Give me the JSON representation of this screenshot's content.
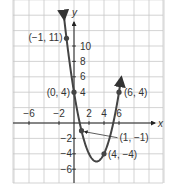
{
  "chart_data": {
    "type": "line",
    "title": "",
    "equation_implied": "y = x^2 - 6x + 4",
    "xlabel": "x",
    "ylabel": "y",
    "xlim": [
      -8,
      12
    ],
    "ylim": [
      -8,
      16
    ],
    "grid": true,
    "x_ticks": [
      {
        "value": -6,
        "label": "−6"
      },
      {
        "value": -2,
        "label": "−2"
      },
      {
        "value": 2,
        "label": "2"
      },
      {
        "value": 4,
        "label": "4"
      },
      {
        "value": 6,
        "label": "6"
      }
    ],
    "y_ticks": [
      {
        "value": 10,
        "label": "10"
      },
      {
        "value": 8,
        "label": "8"
      },
      {
        "value": 6,
        "label": "6"
      },
      {
        "value": 4,
        "label": "4"
      },
      {
        "value": -2,
        "label": "−2"
      },
      {
        "value": -4,
        "label": "−4"
      },
      {
        "value": -6,
        "label": "−6"
      }
    ],
    "points": [
      {
        "x": -1,
        "y": 11,
        "label": "(−1, 11)"
      },
      {
        "x": 0,
        "y": 4,
        "label": "(0, 4)"
      },
      {
        "x": 1,
        "y": -1,
        "label": "(1, −1)"
      },
      {
        "x": 4,
        "y": -4,
        "label": "(4, −4)"
      },
      {
        "x": 6,
        "y": 4,
        "label": "(6, 4)"
      }
    ],
    "series": [
      {
        "name": "parabola",
        "x": [
          -1.3,
          -1,
          0,
          1,
          2,
          3,
          4,
          5,
          6,
          6.3
        ],
        "values": [
          13.49,
          11,
          4,
          -1,
          -4,
          -5,
          -4,
          -1,
          4,
          5.89
        ]
      }
    ]
  }
}
